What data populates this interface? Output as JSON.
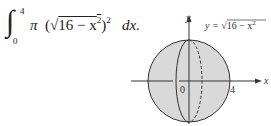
{
  "formula": {
    "integral_symbol": "∫",
    "upper_limit": "4",
    "lower_limit": "0",
    "pi": "π",
    "open_paren": "(",
    "sqrt_symbol": "√",
    "radicand": "16 − x",
    "radicand_exp": "2",
    "close_paren": ")",
    "outer_exp": "2",
    "differential": "dx."
  },
  "figure": {
    "y_axis_label": "y",
    "x_axis_label": "x",
    "origin_label": "0",
    "x_tick_label": "4",
    "curve_label_prefix": "y = ",
    "curve_label_sqrt": "√",
    "curve_label_radicand": "16 − x",
    "curve_label_exp": "2",
    "fill_color": "#d9d9d9",
    "stroke_color": "#333333"
  }
}
